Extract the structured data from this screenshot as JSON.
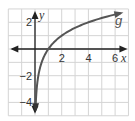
{
  "chart_data": {
    "type": "line",
    "title": "",
    "xlabel": "x",
    "ylabel": "y",
    "xlim": [
      -2,
      7
    ],
    "ylim": [
      -5,
      3
    ],
    "grid": true,
    "x_ticks_labeled": [
      2,
      4,
      6
    ],
    "y_ticks_labeled": [
      2,
      -2,
      -4
    ],
    "x_tick_labels": [
      "2",
      "4",
      "6"
    ],
    "y_tick_labels": [
      "2",
      "−2",
      "−4"
    ],
    "series": [
      {
        "name": "g",
        "function": "log2(x)",
        "x": [
          0.044,
          0.0625,
          0.125,
          0.25,
          0.5,
          1,
          2,
          3,
          4,
          5,
          6,
          6.4
        ],
        "y": [
          -4.5,
          -4,
          -3,
          -2,
          -1,
          0,
          1,
          1.58,
          2,
          2.32,
          2.58,
          2.68
        ]
      }
    ],
    "annotations": [
      {
        "text": "g",
        "x": 6.3,
        "y": 2.1
      }
    ],
    "colors": {
      "curve": "#555555",
      "axis": "#222222",
      "grid": "#d4d4d4"
    }
  }
}
